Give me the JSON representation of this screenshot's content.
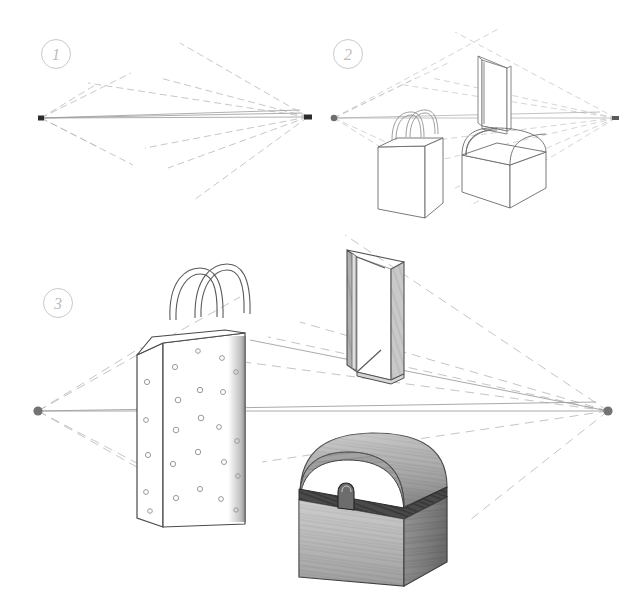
{
  "figure": {
    "title": "Two-Point Perspective Drawing Tutorial",
    "medium": "pencil line drawing on white paper",
    "background_color": "#ffffff",
    "ink_color": "#3a3a3a",
    "construction_line_color": "#b5b5b5",
    "shading_color": "#8a8a8a",
    "step_badge_color": "#bdbdbd"
  },
  "steps": [
    {
      "number": "1",
      "label": "Step 1",
      "caption": "Establish the horizon line and two vanishing points, then draw guide rays",
      "badge_position": {
        "x": 56,
        "y": 54
      },
      "horizon": {
        "y": 118,
        "x_start": 41,
        "x_end": 308
      },
      "vanishing_points": [
        {
          "name": "left-vanishing-point",
          "x": 41,
          "y": 118,
          "marker": "square",
          "color": "#2b2b2b"
        },
        {
          "name": "right-vanishing-point",
          "x": 308,
          "y": 117,
          "marker": "square",
          "color": "#2b2b2b"
        }
      ]
    },
    {
      "number": "2",
      "label": "Step 2",
      "caption": "Block in the three objects as wireframe boxes on the perspective grid",
      "badge_position": {
        "x": 348,
        "y": 54
      },
      "horizon": {
        "y": 118,
        "x_start": 334,
        "x_end": 616
      },
      "vanishing_points": [
        {
          "name": "left-vanishing-point",
          "x": 334,
          "y": 118,
          "marker": "dot",
          "color": "#6e6e6e"
        },
        {
          "name": "right-vanishing-point",
          "x": 616,
          "y": 118,
          "marker": "dot",
          "color": "#6e6e6e"
        }
      ],
      "objects": [
        {
          "name": "shopping-bag",
          "state": "outline"
        },
        {
          "name": "open-book",
          "state": "outline"
        },
        {
          "name": "treasure-chest",
          "state": "outline"
        }
      ]
    },
    {
      "number": "3",
      "label": "Step 3",
      "caption": "Render the objects with texture, shading and surface detail",
      "badge_position": {
        "x": 58,
        "y": 303
      },
      "horizon": {
        "y": 411,
        "x_start": 38,
        "x_end": 608
      },
      "vanishing_points": [
        {
          "name": "left-vanishing-point",
          "x": 38,
          "y": 411,
          "marker": "dot",
          "color": "#737373"
        },
        {
          "name": "right-vanishing-point",
          "x": 608,
          "y": 411,
          "marker": "dot",
          "color": "#737373"
        }
      ],
      "objects": [
        {
          "name": "shopping-bag",
          "state": "rendered",
          "detail": "polka dots, twin rope handles, shaded right edge"
        },
        {
          "name": "open-book",
          "state": "rendered",
          "detail": "standing open book with shaded covers and spine"
        },
        {
          "name": "treasure-chest",
          "state": "rendered",
          "detail": "domed lid, dark band, metal latch, wood-grain texture"
        }
      ]
    }
  ],
  "objects_legend": [
    {
      "key": "shopping-bag",
      "label": "Shopping bag"
    },
    {
      "key": "open-book",
      "label": "Open book"
    },
    {
      "key": "treasure-chest",
      "label": "Treasure chest"
    }
  ]
}
